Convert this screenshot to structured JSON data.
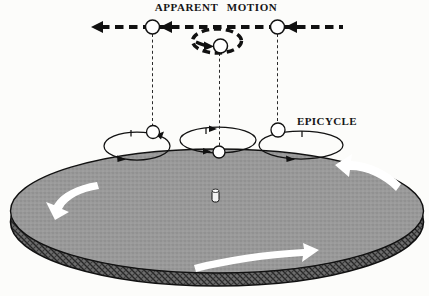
{
  "labels": {
    "apparent_motion": "APPARENT MOTION",
    "epicycle": "EPICYCLE"
  },
  "colors": {
    "background": "#fcfcfa",
    "ink": "#151515",
    "disk_surface_gray": "#9a9a9a",
    "disk_rim_dark": "#565656",
    "rotation_arrow_white": "#ffffff",
    "planet_fill": "#ffffff"
  },
  "figure": {
    "apparent_motion_direction": "left",
    "retrograde_loop_present": true,
    "epicycle_count": 3,
    "planet_markers_on_path": 3,
    "planet_markers_on_epicycles": 3,
    "disk_rotation_arrow_positions": [
      "upper-right",
      "left-edge",
      "bottom"
    ],
    "center_body": "central peg on disk"
  }
}
